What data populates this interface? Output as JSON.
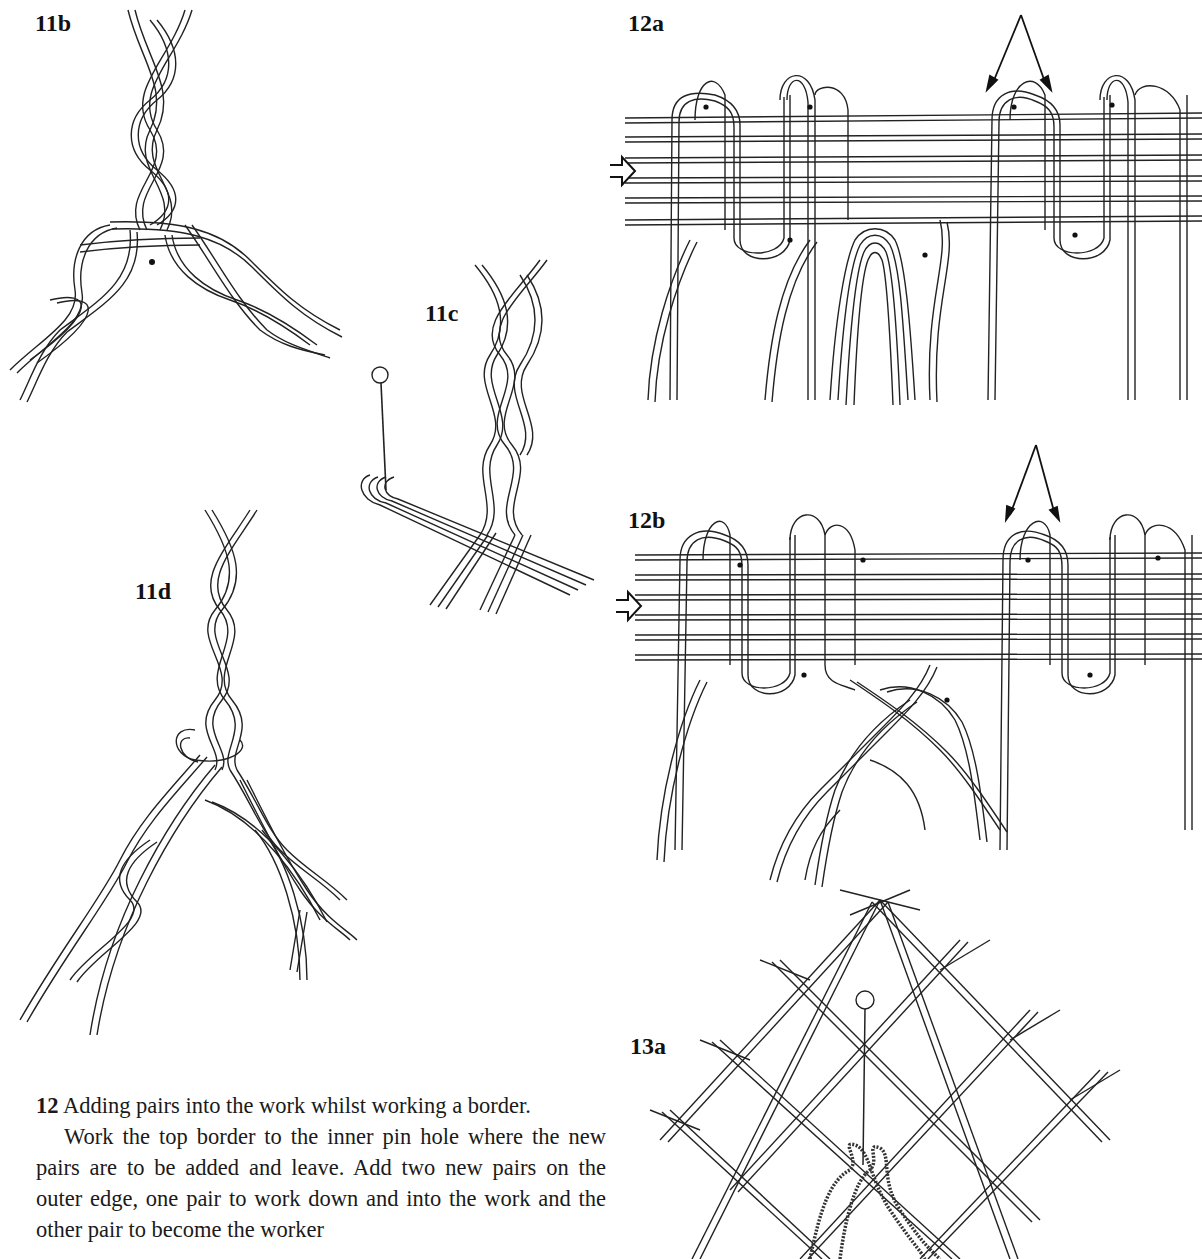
{
  "page": {
    "figures": [
      {
        "id": "11b",
        "label": "11b",
        "description": "Plait splitting into two plaits at a pin hole"
      },
      {
        "id": "11c",
        "label": "11c",
        "description": "Plait with pin and pairs crossing"
      },
      {
        "id": "11d",
        "label": "11d",
        "description": "Plait dividing with looped crossing"
      },
      {
        "id": "12a",
        "label": "12a",
        "description": "Border with new pairs added, arrows marking pin hole"
      },
      {
        "id": "12b",
        "label": "12b",
        "description": "Border with added pairs worked into plaits"
      },
      {
        "id": "13a",
        "label": "13a",
        "description": "Ground of twisted pairs with a pin"
      }
    ],
    "caption": {
      "number": "12",
      "title": "Adding pairs into the work whilst working a border.",
      "body": "Work the top border to the inner pin hole where the new pairs are to be added and leave. Add two new pairs on the outer edge, one pair to work down and into the work and the other pair to become the worker"
    }
  }
}
